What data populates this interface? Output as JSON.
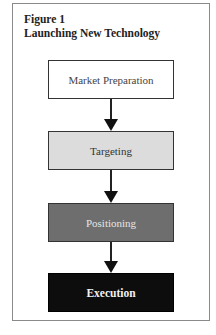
{
  "figure": {
    "label": "Figure 1",
    "title": "Launching New Technology"
  },
  "flowchart": {
    "steps": [
      {
        "label": "Market Preparation",
        "fill": "#ffffff",
        "text_color": "#444444"
      },
      {
        "label": "Targeting",
        "fill": "#dcdcdc",
        "text_color": "#333333"
      },
      {
        "label": "Positioning",
        "fill": "#6e6e6e",
        "text_color": "#e6e6e6"
      },
      {
        "label": "Execution",
        "fill": "#0d0d0d",
        "text_color": "#f2f2f2"
      }
    ],
    "connectors": [
      "down-arrow",
      "down-arrow",
      "down-arrow"
    ]
  }
}
